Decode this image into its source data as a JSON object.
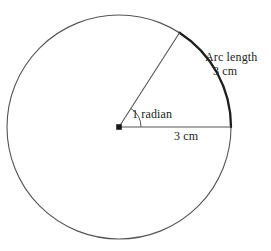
{
  "figure": {
    "background_color": "#ffffff",
    "stroke_color": "#4a4a4a",
    "bold_stroke_color": "#1f1f1f",
    "text_color": "#232323",
    "center_marker_color": "#1a1a1a"
  },
  "labels": {
    "arc_length_title": "Arc length",
    "arc_length_value": "3 cm",
    "central_angle": "1 radian",
    "radius_value": "3 cm"
  },
  "geometry": {
    "center_x": 119,
    "center_y": 127,
    "radius_px": 112,
    "angle_radians": 1,
    "angle_degrees": 57.2958,
    "radius_label_cm": 3,
    "arc_label_cm": 3,
    "arc_start_x": 231,
    "arc_start_y": 127,
    "arc_end_x": 179.5,
    "arc_end_y": 32.7,
    "angle_arc_radius_px": 22
  }
}
